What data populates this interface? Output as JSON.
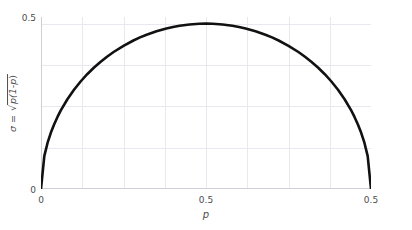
{
  "chart_data": {
    "type": "line",
    "title": "",
    "subtitle": "",
    "xlabel": "p",
    "ylabel": "σ = √(p(1-p))",
    "ylabel_parts": {
      "sigma": "σ",
      "equals": " = ",
      "radical": "√",
      "radicand_left": "p(1-",
      "radicand_var": "p",
      "radicand_right": ")"
    },
    "xlim": [
      0,
      1
    ],
    "ylim": [
      0,
      0.52
    ],
    "grid": true,
    "legend": null,
    "legend_position": "none",
    "line_color": "#111111",
    "line_width": 2.6,
    "grid_color": "#e8e8ef",
    "axis_color": "#cfcfd6",
    "tick_text_color": "#4d4d4d",
    "background_color": "#ffffff",
    "xticks": [
      {
        "value": 0.0,
        "label": "0",
        "pos_px": 41
      },
      {
        "value": 0.5,
        "label": "0.5",
        "pos_px": 206
      },
      {
        "value": 1.0,
        "label": "0.5",
        "pos_px": 371
      }
    ],
    "yticks": [
      {
        "value": 0.0,
        "label": "0"
      },
      {
        "value": 0.5,
        "label": "0.5"
      }
    ],
    "xgrid_values": [
      0.0,
      0.125,
      0.25,
      0.375,
      0.5,
      0.625,
      0.75,
      0.875,
      1.0
    ],
    "ygrid_values": [
      0.0,
      0.125,
      0.25,
      0.375,
      0.5
    ],
    "series": [
      {
        "name": "sigma",
        "formula": "sigma = sqrt(p*(1-p))",
        "x": [
          0.0,
          0.01,
          0.02,
          0.03,
          0.04,
          0.05,
          0.06,
          0.08,
          0.1,
          0.12,
          0.14,
          0.16,
          0.18,
          0.2,
          0.22,
          0.25,
          0.28,
          0.3,
          0.32,
          0.35,
          0.38,
          0.4,
          0.42,
          0.45,
          0.48,
          0.5,
          0.52,
          0.55,
          0.58,
          0.6,
          0.62,
          0.65,
          0.68,
          0.7,
          0.72,
          0.75,
          0.78,
          0.8,
          0.82,
          0.84,
          0.86,
          0.88,
          0.9,
          0.92,
          0.94,
          0.95,
          0.96,
          0.97,
          0.98,
          0.99,
          1.0
        ],
        "y": [
          0.0,
          0.0995,
          0.14,
          0.1706,
          0.196,
          0.2179,
          0.2375,
          0.2713,
          0.3,
          0.325,
          0.347,
          0.3666,
          0.3842,
          0.4,
          0.4142,
          0.433,
          0.449,
          0.4583,
          0.4665,
          0.477,
          0.4854,
          0.4899,
          0.4936,
          0.4975,
          0.4996,
          0.5,
          0.4996,
          0.4975,
          0.4936,
          0.4899,
          0.4854,
          0.477,
          0.4665,
          0.4583,
          0.449,
          0.433,
          0.4142,
          0.4,
          0.3842,
          0.3666,
          0.347,
          0.325,
          0.3,
          0.2713,
          0.2375,
          0.2179,
          0.196,
          0.1706,
          0.14,
          0.0995,
          0.0
        ]
      }
    ]
  }
}
